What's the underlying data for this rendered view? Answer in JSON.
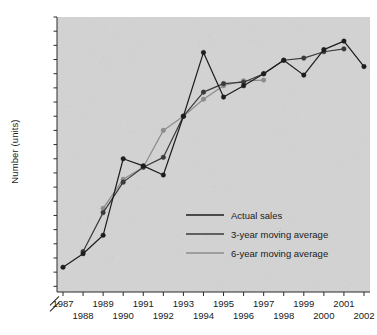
{
  "chart_data": {
    "type": "line",
    "title": "",
    "xlabel": "",
    "ylabel": "Number (units)",
    "x": [
      1987,
      1988,
      1989,
      1990,
      1991,
      1992,
      1993,
      1994,
      1995,
      1996,
      1997,
      1998,
      1999,
      2000,
      2001,
      2002
    ],
    "xticklabels": [
      "1987",
      "1988",
      "1989",
      "1990",
      "1991",
      "1992",
      "1993",
      "1994",
      "1995",
      "1996",
      "1997",
      "1998",
      "1999",
      "2000",
      "2001",
      "2002"
    ],
    "yticklabels": [
      "2700",
      "2600",
      "2500",
      "2400",
      "2300",
      "2200",
      "2100",
      "2000",
      "1900",
      "1800",
      "1700",
      "1600",
      "1500",
      "1400",
      "1300",
      "1200",
      "1100",
      "1000",
      "900",
      "800"
    ],
    "yticks": [
      2700,
      2600,
      2500,
      2400,
      2300,
      2200,
      2100,
      2000,
      1900,
      1800,
      1700,
      1600,
      1500,
      1400,
      1300,
      1200,
      1100,
      1000,
      900,
      800
    ],
    "ylim": [
      760,
      2700
    ],
    "xlim": [
      1987,
      2002
    ],
    "grid": false,
    "axis_break": true,
    "axis_break_note": "double-slash break on y-axis below 800",
    "plot_background": "#d2d2d2",
    "legend_position": "inside-lower-right",
    "series": [
      {
        "name": "Actual sales",
        "color": "#1c1c1c",
        "marker": "circle",
        "x": [
          1987,
          1988,
          1989,
          1990,
          1991,
          1992,
          1993,
          1994,
          1995,
          1996,
          1997,
          1998,
          1999,
          2000,
          2001,
          2002
        ],
        "values": [
          935,
          1030,
          1160,
          1700,
          1650,
          1585,
          2000,
          2450,
          2135,
          2215,
          2300,
          2395,
          2290,
          2470,
          2530,
          2350
        ]
      },
      {
        "name": "3-year moving average",
        "color": "#3a3a3a",
        "marker": "circle",
        "x": [
          1988,
          1989,
          1990,
          1991,
          1992,
          1993,
          1994,
          1995,
          1996,
          1997,
          1998,
          1999,
          2000,
          2001
        ],
        "values": [
          1045,
          1320,
          1535,
          1640,
          1710,
          2000,
          2170,
          2230,
          2240,
          2300,
          2395,
          2410,
          2455,
          2475
        ]
      },
      {
        "name": "6-year moving average",
        "color": "#8c8c8c",
        "marker": "circle",
        "x": [
          1989,
          1990,
          1991,
          1992,
          1993,
          1994,
          1995,
          1996,
          1997
        ],
        "values": [
          1350,
          1555,
          1640,
          1900,
          2000,
          2120,
          2215,
          2250,
          2255
        ]
      }
    ],
    "legend": [
      {
        "label": "Actual sales",
        "color": "#1c1c1c"
      },
      {
        "label": "3-year moving average",
        "color": "#3a3a3a"
      },
      {
        "label": "6-year moving average",
        "color": "#8c8c8c"
      }
    ]
  }
}
